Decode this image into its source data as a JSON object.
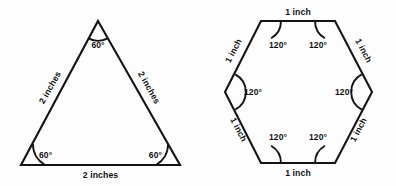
{
  "figure": {
    "background_color": "#fdfdfd",
    "stroke_color": "#141414",
    "text_color": "#111111"
  },
  "triangle": {
    "name": "equilateral-triangle",
    "sides": {
      "left_label": "2 inches",
      "right_label": "2 inches",
      "bottom_label": "2 inches"
    },
    "angles": {
      "apex_label": "60°",
      "bottom_left_label": "60°",
      "bottom_right_label": "60°"
    },
    "geometry": {
      "apex": [
        98,
        21
      ],
      "bottom_left": [
        21,
        165
      ],
      "bottom_right": [
        180,
        165
      ]
    }
  },
  "hexagon": {
    "name": "regular-hexagon",
    "sides": {
      "top_label": "1 inch",
      "upper_left_label": "1 inch",
      "lower_left_label": "1 inch",
      "bottom_label": "1 inch",
      "lower_right_label": "1 inch",
      "upper_right_label": "1 inch"
    },
    "angles": {
      "top_left_label": "120°",
      "top_right_label": "120°",
      "middle_left_label": "120°",
      "middle_right_label": "120°",
      "bottom_left_label": "120°",
      "bottom_right_label": "120°"
    },
    "geometry": {
      "top_left": [
        261,
        21
      ],
      "top_right": [
        335,
        21
      ],
      "right": [
        372,
        92
      ],
      "bottom_right": [
        335,
        163
      ],
      "bottom_left": [
        261,
        163
      ],
      "left": [
        225,
        92
      ]
    }
  }
}
